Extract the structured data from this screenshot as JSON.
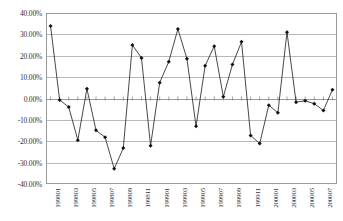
{
  "chart_data": {
    "type": "line",
    "title": "",
    "xlabel": "",
    "ylabel": "",
    "ylim": [
      -0.4,
      0.4
    ],
    "ytick_labels": [
      "40.00%",
      "30.00%",
      "20.00%",
      "10.00%",
      "0.00%",
      "-10.00%",
      "-20.00%",
      "-30.00%",
      "-40.00%"
    ],
    "ytick_values": [
      0.4,
      0.3,
      0.2,
      0.1,
      0.0,
      -0.1,
      -0.2,
      -0.3,
      -0.4
    ],
    "grid": true,
    "legend": "none",
    "marker": "diamond",
    "line_color": "#1a1a1a",
    "grid_color": "#b8b8b8",
    "x": [
      "199801",
      "199802",
      "199803",
      "199804",
      "199805",
      "199806",
      "199807",
      "199808",
      "199809",
      "199810",
      "199811",
      "199812",
      "199901",
      "199902",
      "199903",
      "199904",
      "199905",
      "199906",
      "199907",
      "199908",
      "199909",
      "199910",
      "199911",
      "199912",
      "200001",
      "200002",
      "200003",
      "200004",
      "200005",
      "200006",
      "200007",
      "200008"
    ],
    "xtick_labels": [
      "199801",
      "199803",
      "199805",
      "199807",
      "199809",
      "199811",
      "199901",
      "199903",
      "199905",
      "199907",
      "199909",
      "199911",
      "200001",
      "200003",
      "200005",
      "200007"
    ],
    "categories": [
      "199801",
      "199802",
      "199803",
      "199804",
      "199805",
      "199806",
      "199807",
      "199808",
      "199809",
      "199810",
      "199811",
      "199812",
      "199901",
      "199902",
      "199903",
      "199904",
      "199905",
      "199906",
      "199907",
      "199908",
      "199909",
      "199910",
      "199911",
      "199912",
      "200001",
      "200002",
      "200003",
      "200004",
      "200005",
      "200006",
      "200007",
      "200008"
    ],
    "values": [
      0.339,
      -0.007,
      -0.04,
      -0.195,
      0.046,
      -0.149,
      -0.181,
      -0.329,
      -0.232,
      0.25,
      0.19,
      -0.221,
      0.074,
      0.172,
      0.325,
      0.186,
      -0.13,
      0.153,
      0.245,
      0.008,
      0.159,
      0.265,
      -0.173,
      -0.211,
      -0.031,
      -0.067,
      0.31,
      -0.017,
      -0.011,
      -0.024,
      -0.056,
      0.041
    ]
  }
}
